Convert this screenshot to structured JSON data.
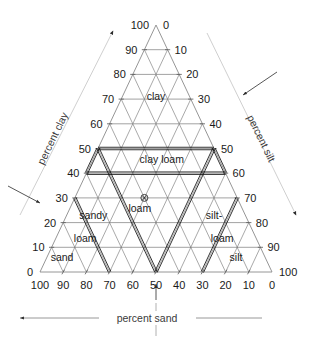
{
  "figure": {
    "kind": "soil-texture-ternary-triangle",
    "background": "#ffffff",
    "line_color": "#6e6e6e",
    "boundary_color": "#111111"
  },
  "chart_data": {
    "type": "scatter",
    "subtype": "ternary-soil-texture-triangle",
    "title": "",
    "grid": true,
    "legend": "none",
    "axes": [
      {
        "name": "clay",
        "title": "percent clay",
        "position": "left",
        "range": [
          0,
          100
        ],
        "ticks": [
          0,
          10,
          20,
          30,
          40,
          50,
          60,
          70,
          80,
          90,
          100
        ],
        "tick_labels": [
          "0",
          "10",
          "20",
          "30",
          "40",
          "50",
          "60",
          "70",
          "80",
          "90",
          "100"
        ],
        "direction": "bottom-left to apex"
      },
      {
        "name": "silt",
        "title": "percent silt",
        "position": "right",
        "range": [
          0,
          100
        ],
        "ticks": [
          0,
          10,
          20,
          30,
          40,
          50,
          60,
          70,
          80,
          90,
          100
        ],
        "tick_labels": [
          "0",
          "10",
          "20",
          "30",
          "40",
          "50",
          "60",
          "70",
          "80",
          "90",
          "100"
        ],
        "direction": "apex to bottom-right"
      },
      {
        "name": "sand",
        "title": "percent sand",
        "position": "bottom",
        "range": [
          0,
          100
        ],
        "ticks": [
          100,
          90,
          80,
          70,
          60,
          50,
          40,
          30,
          20,
          10,
          0
        ],
        "tick_labels": [
          "100",
          "90",
          "80",
          "70",
          "60",
          "50",
          "40",
          "30",
          "20",
          "10",
          "0"
        ],
        "direction": "bottom-right to bottom-left"
      }
    ],
    "classes": [
      {
        "name": "clay",
        "label": "clay",
        "label2": "",
        "clay": 70,
        "silt": 15,
        "sand": 15
      },
      {
        "name": "clay-loam",
        "label": "clay",
        "label2": "loam",
        "clay": 45,
        "silt": 30,
        "sand": 25
      },
      {
        "name": "sandy-loam",
        "label": "sandy",
        "label2": "loam",
        "clay": 20,
        "silt": 12,
        "sand": 68
      },
      {
        "name": "loam",
        "label": "loam",
        "label2": "",
        "clay": 25,
        "silt": 28,
        "sand": 47
      },
      {
        "name": "silt-loam",
        "label": "silt-",
        "label2": "loam",
        "clay": 20,
        "silt": 62,
        "sand": 18
      },
      {
        "name": "sand",
        "label": "sand",
        "label2": "",
        "clay": 5,
        "silt": 7,
        "sand": 88
      },
      {
        "name": "silt",
        "label": "silt",
        "label2": "",
        "clay": 5,
        "silt": 82,
        "sand": 13
      }
    ],
    "class_label_text": {
      "clay": "clay",
      "clay_loam": "clay loam",
      "sandy_loam_line1": "sandy",
      "sandy_loam_line2": "loam",
      "loam": "loam",
      "silt_loam_line1": "silt-",
      "silt_loam_line2": "loam",
      "sand": "sand",
      "silt": "silt"
    },
    "boundaries": [
      {
        "name": "clay-loam-region",
        "description": "double-ruled quadrilateral enclosing clay loam",
        "vertices_ternary": [
          {
            "clay": 50,
            "silt": 0,
            "sand": 50
          },
          {
            "clay": 50,
            "silt": 50,
            "sand": 0
          },
          {
            "clay": 40,
            "silt": 60,
            "sand": 0
          },
          {
            "clay": 40,
            "silt": 0,
            "sand": 60
          }
        ]
      },
      {
        "name": "loam-wedge",
        "description": "double-ruled V converging at 50 percent sand on baseline",
        "vertices_ternary": [
          {
            "clay": 50,
            "silt": 0,
            "sand": 50
          },
          {
            "clay": 0,
            "silt": 50,
            "sand": 50
          },
          {
            "clay": 50,
            "silt": 50,
            "sand": 0
          }
        ]
      },
      {
        "name": "sandy-loam-divider",
        "description": "double-ruled line from clay 30 on left axis to sand 70 on baseline",
        "vertices_ternary": [
          {
            "clay": 30,
            "silt": 0,
            "sand": 70
          },
          {
            "clay": 0,
            "silt": 30,
            "sand": 70
          }
        ]
      },
      {
        "name": "silt-loam-divider",
        "description": "double-ruled line from silt 70 on right axis to sand 30 on baseline",
        "vertices_ternary": [
          {
            "clay": 0,
            "silt": 70,
            "sand": 30
          },
          {
            "clay": 30,
            "silt": 70,
            "sand": 0
          }
        ]
      }
    ],
    "data_points": [
      {
        "name": "sample-point",
        "marker": "circled-x",
        "clay": 30,
        "silt": 30,
        "sand": 40,
        "label": "loam"
      }
    ],
    "annotations": [
      {
        "name": "clay-axis-arrow",
        "target": "percent clay",
        "direction": "up-right",
        "style": "filled-triangle"
      },
      {
        "name": "silt-axis-arrow",
        "target": "percent silt",
        "direction": "down-right",
        "style": "filled-triangle"
      },
      {
        "name": "sand-axis-arrow",
        "target": "percent sand",
        "direction": "left",
        "style": "open-arrow"
      },
      {
        "name": "clay-value-pointer",
        "target": "clay 30",
        "direction": "down-right",
        "style": "open-arrow"
      },
      {
        "name": "silt-value-pointer",
        "target": "silt 30",
        "direction": "down-left",
        "style": "open-arrow"
      },
      {
        "name": "sand-value-pointer",
        "target": "sand 40",
        "direction": "up",
        "style": "open-arrow"
      }
    ]
  }
}
